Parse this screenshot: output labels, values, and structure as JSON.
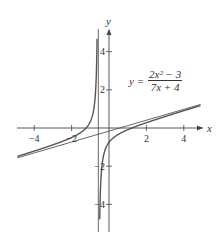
{
  "chart_data": {
    "type": "line",
    "title": "",
    "xlabel": "x",
    "ylabel": "y",
    "xlim": [
      -5,
      5.2
    ],
    "ylim": [
      -5.2,
      5.2
    ],
    "x_ticks": [
      -4,
      -2,
      2,
      4
    ],
    "x_tick_labels": [
      "−4",
      "−2",
      "2",
      "4"
    ],
    "y_ticks": [
      4,
      2,
      -2,
      -4
    ],
    "y_tick_labels": [
      "4",
      "2",
      "−2",
      "−4"
    ],
    "grid": false,
    "legend": null,
    "annotation": {
      "lhs": "y =",
      "numerator": "2x² − 3",
      "denominator": "7x + 4"
    },
    "series": [
      {
        "name": "y = (2x^2 - 3)/(7x + 4)",
        "kind": "function",
        "vertical_asymptote": -0.5714,
        "color": "#555555"
      },
      {
        "name": "slant asymptote y = (2/7)x - 8/49",
        "kind": "line",
        "slope": 0.2857,
        "intercept": -0.1633,
        "color": "#555555"
      },
      {
        "name": "vertical asymptote x = -4/7",
        "kind": "vline",
        "x": -0.5714,
        "color": "#555555"
      }
    ],
    "colors": {
      "axis": "#444444",
      "curve": "#555555"
    }
  }
}
